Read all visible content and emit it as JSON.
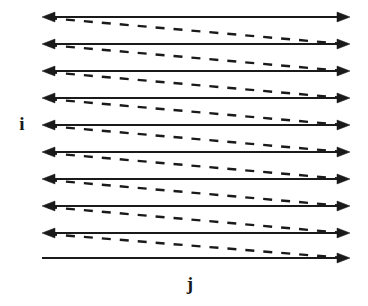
{
  "figure": {
    "kind": "iteration-space-dependence-diagram",
    "background_color": "#ffffff",
    "ink_color": "#1a1a1a",
    "axes": {
      "vertical_label": "i",
      "horizontal_label": "j"
    },
    "geometry": {
      "left_x": 42,
      "right_x": 350,
      "row_count": 10,
      "row_y": [
        17,
        44,
        71,
        98,
        125,
        152,
        179,
        206,
        233,
        258
      ],
      "solid_line_width": 1.4,
      "dashed_line_width": 2.4,
      "dash_pattern": "9 9",
      "arrowhead_length": 13,
      "arrowhead_half_width": 5
    },
    "solid_rows": [
      {
        "index": 0,
        "y": 17,
        "left_arrow": true,
        "right_arrow": true
      },
      {
        "index": 1,
        "y": 44,
        "left_arrow": true,
        "right_arrow": true
      },
      {
        "index": 2,
        "y": 71,
        "left_arrow": true,
        "right_arrow": true
      },
      {
        "index": 3,
        "y": 98,
        "left_arrow": true,
        "right_arrow": true
      },
      {
        "index": 4,
        "y": 125,
        "left_arrow": true,
        "right_arrow": true
      },
      {
        "index": 5,
        "y": 152,
        "left_arrow": true,
        "right_arrow": true
      },
      {
        "index": 6,
        "y": 179,
        "left_arrow": true,
        "right_arrow": true
      },
      {
        "index": 7,
        "y": 206,
        "left_arrow": true,
        "right_arrow": true
      },
      {
        "index": 8,
        "y": 233,
        "left_arrow": true,
        "right_arrow": true
      },
      {
        "index": 9,
        "y": 258,
        "left_arrow": false,
        "right_arrow": true
      }
    ],
    "dashed_diagonals": [
      {
        "index": 0,
        "x1": 48,
        "y1": 18,
        "x2": 344,
        "y2": 44
      },
      {
        "index": 1,
        "x1": 48,
        "y1": 45,
        "x2": 344,
        "y2": 71
      },
      {
        "index": 2,
        "x1": 48,
        "y1": 72,
        "x2": 344,
        "y2": 98
      },
      {
        "index": 3,
        "x1": 48,
        "y1": 99,
        "x2": 344,
        "y2": 125
      },
      {
        "index": 4,
        "x1": 48,
        "y1": 126,
        "x2": 344,
        "y2": 152
      },
      {
        "index": 5,
        "x1": 48,
        "y1": 153,
        "x2": 344,
        "y2": 179
      },
      {
        "index": 6,
        "x1": 48,
        "y1": 180,
        "x2": 344,
        "y2": 206
      },
      {
        "index": 7,
        "x1": 48,
        "y1": 207,
        "x2": 344,
        "y2": 233
      },
      {
        "index": 8,
        "x1": 48,
        "y1": 234,
        "x2": 344,
        "y2": 258
      }
    ]
  }
}
